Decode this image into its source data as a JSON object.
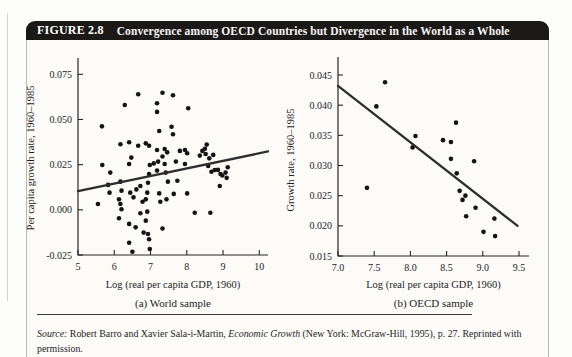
{
  "figure": {
    "label": "FIGURE 2.8",
    "title": "Convergence among OECD Countries but Divergence in the World as a Whole"
  },
  "source": {
    "label_italic": "Source:",
    "authors": " Robert Barro and Xavier Sala-i-Martin, ",
    "work_italic": "Economic Growth",
    "rest": " (New York: McGraw-Hill, 1995), p. 27. Reprinted with permission."
  },
  "colors": {
    "title_bar_bg": "#1a1918",
    "title_text": "#ffffff",
    "axis": "#272727",
    "tick_text": "#1c1c1c",
    "point": "#141414",
    "trend_line": "#2e2e2e",
    "box_border": "#b9b7b1",
    "divider": "#3c3c3c"
  },
  "chart_data": [
    {
      "type": "scatter",
      "name": "world-sample",
      "caption": "(a) World sample",
      "xlabel": "Log (real per capita GDP, 1960)",
      "ylabel": "Per capita growth rate, 1960–1985",
      "xlim": [
        5,
        10
      ],
      "ylim": [
        -0.025,
        0.075
      ],
      "xticks": [
        "5",
        "6",
        "7",
        "8",
        "9",
        "10"
      ],
      "yticks": [
        "0.075",
        "0.050",
        "0.025",
        "0.000",
        "-0.025"
      ],
      "grid": false,
      "legend": "none",
      "trendline": {
        "x1": 5.0,
        "y1": 0.0104,
        "x2": 10.24,
        "y2": 0.0323
      },
      "points": [
        [
          5.55,
          0.0032
        ],
        [
          5.66,
          0.0462
        ],
        [
          5.67,
          0.0248
        ],
        [
          5.83,
          0.0138
        ],
        [
          5.87,
          0.0095
        ],
        [
          5.89,
          0.0206
        ],
        [
          6.13,
          0.0058
        ],
        [
          6.13,
          -0.0047
        ],
        [
          6.17,
          0.0363
        ],
        [
          6.17,
          0.0156
        ],
        [
          6.17,
          0.0032
        ],
        [
          6.2,
          0.0106
        ],
        [
          6.2,
          0.0003
        ],
        [
          6.29,
          0.058
        ],
        [
          6.41,
          0.0374
        ],
        [
          6.41,
          0.0254
        ],
        [
          6.41,
          -0.0078
        ],
        [
          6.41,
          -0.0182
        ],
        [
          6.44,
          0.0095
        ],
        [
          6.47,
          0.0289
        ],
        [
          6.5,
          -0.0232
        ],
        [
          6.53,
          0.0069
        ],
        [
          6.59,
          -0.0097
        ],
        [
          6.61,
          0.0113
        ],
        [
          6.66,
          0.064
        ],
        [
          6.66,
          0.0355
        ],
        [
          6.72,
          0.0132
        ],
        [
          6.72,
          -0.0019
        ],
        [
          6.78,
          0.0045
        ],
        [
          6.81,
          -0.0126
        ],
        [
          6.87,
          0.0368
        ],
        [
          6.87,
          0.0058
        ],
        [
          6.87,
          -0.006
        ],
        [
          6.91,
          0.0095
        ],
        [
          6.91,
          -0.001
        ],
        [
          6.93,
          0.015
        ],
        [
          6.93,
          -0.0134
        ],
        [
          6.96,
          0.0355
        ],
        [
          6.96,
          0.0198
        ],
        [
          6.96,
          -0.0163
        ],
        [
          6.98,
          0.0248
        ],
        [
          6.98,
          -0.0217
        ],
        [
          7.09,
          0.0257
        ],
        [
          7.18,
          0.059
        ],
        [
          7.18,
          0.0542
        ],
        [
          7.18,
          0.0331
        ],
        [
          7.18,
          0.0217
        ],
        [
          7.21,
          0.0267
        ],
        [
          7.24,
          0.0436
        ],
        [
          7.24,
          0.0091
        ],
        [
          7.27,
          0.0045
        ],
        [
          7.33,
          0.0648
        ],
        [
          7.33,
          0.0295
        ],
        [
          7.33,
          -0.0103
        ],
        [
          7.39,
          0.0337
        ],
        [
          7.39,
          0.0254
        ],
        [
          7.42,
          0.0206
        ],
        [
          7.44,
          0.0058
        ],
        [
          7.46,
          0.0318
        ],
        [
          7.48,
          0.0156
        ],
        [
          7.58,
          0.046
        ],
        [
          7.62,
          0.0634
        ],
        [
          7.62,
          0.0418
        ],
        [
          7.64,
          0.0088
        ],
        [
          7.7,
          0.0267
        ],
        [
          7.74,
          0.0161
        ],
        [
          7.81,
          0.0326
        ],
        [
          7.95,
          0.0331
        ],
        [
          7.95,
          0.0254
        ],
        [
          8.01,
          0.0313
        ],
        [
          8.01,
          0.0091
        ],
        [
          8.04,
          0.0562
        ],
        [
          8.22,
          -0.0016
        ],
        [
          8.36,
          0.03
        ],
        [
          8.43,
          0.0326
        ],
        [
          8.5,
          0.0338
        ],
        [
          8.52,
          0.0309
        ],
        [
          8.55,
          0.0361
        ],
        [
          8.59,
          0.0243
        ],
        [
          8.62,
          0.0285
        ],
        [
          8.65,
          -0.0016
        ],
        [
          8.68,
          0.0211
        ],
        [
          8.73,
          0.0304
        ],
        [
          8.77,
          0.022
        ],
        [
          8.86,
          0.0221
        ],
        [
          8.91,
          0.0132
        ],
        [
          8.93,
          0.0198
        ],
        [
          8.98,
          0.019
        ],
        [
          9.07,
          0.0206
        ],
        [
          9.1,
          0.0177
        ],
        [
          9.13,
          0.0236
        ]
      ]
    },
    {
      "type": "scatter",
      "name": "oecd-sample",
      "caption": "(b) OECD sample",
      "xlabel": "Log (real per capita GDP, 1960)",
      "ylabel": "Growth rate, 1960–1985",
      "xlim": [
        7.0,
        9.5
      ],
      "ylim": [
        0.015,
        0.045
      ],
      "xticks": [
        "7.0",
        "7.5",
        "8.0",
        "8.5",
        "9.0",
        "9.5"
      ],
      "yticks": [
        "0.045",
        "0.040",
        "0.035",
        "0.030",
        "0.025",
        "0.020",
        "0.015"
      ],
      "grid": false,
      "legend": "none",
      "trendline": {
        "x1": 7.0,
        "y1": 0.0432,
        "x2": 9.48,
        "y2": 0.02
      },
      "points": [
        [
          7.4,
          0.0263
        ],
        [
          7.53,
          0.0398
        ],
        [
          7.65,
          0.0438
        ],
        [
          8.03,
          0.033
        ],
        [
          8.07,
          0.0349
        ],
        [
          8.45,
          0.0342
        ],
        [
          8.56,
          0.0339
        ],
        [
          8.56,
          0.0311
        ],
        [
          8.63,
          0.0371
        ],
        [
          8.64,
          0.0287
        ],
        [
          8.68,
          0.0258
        ],
        [
          8.76,
          0.025
        ],
        [
          8.72,
          0.0243
        ],
        [
          8.88,
          0.0307
        ],
        [
          8.9,
          0.023
        ],
        [
          8.77,
          0.0216
        ],
        [
          9.01,
          0.019
        ],
        [
          9.16,
          0.0212
        ],
        [
          9.17,
          0.0183
        ]
      ]
    }
  ]
}
